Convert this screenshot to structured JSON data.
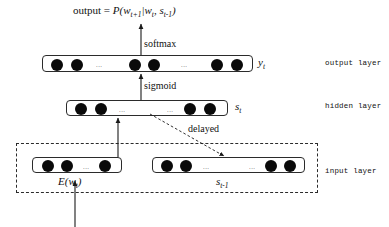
{
  "figure": {
    "title_formula": {
      "prefix": "output = ",
      "body": "P(w",
      "sub1": "t+1",
      "mid": "|w",
      "sub2": "t",
      "comma": ", s",
      "sub3": "t-1",
      "suffix": ")",
      "plain": "output = P(w_t+1|w_t, s_t-1)"
    },
    "operations": [
      {
        "name": "softmax",
        "label": "softmax"
      },
      {
        "name": "sigmoid",
        "label": "sigmoid"
      },
      {
        "name": "delayed",
        "label": "delayed"
      }
    ],
    "layer_names": [
      {
        "key": "output",
        "label": "output layer"
      },
      {
        "key": "hidden",
        "label": "hidden layer"
      },
      {
        "key": "input",
        "label": "input layer"
      }
    ],
    "layers": [
      {
        "key": "output",
        "symbol_base": "y",
        "symbol_sub": "t",
        "symbol_plain": "y_t",
        "node_count": 6,
        "ellipsis_count": 2,
        "ellipsis_glyph": "..."
      },
      {
        "key": "hidden",
        "symbol_base": "s",
        "symbol_sub": "t",
        "symbol_plain": "s_t",
        "node_count": 4,
        "ellipsis_count": 2,
        "ellipsis_glyph": "..."
      },
      {
        "key": "input_embedding",
        "symbol_base": "E(w",
        "symbol_sub": "t",
        "symbol_suffix": ")",
        "symbol_plain": "E(w_t)",
        "node_count": 3,
        "ellipsis_count": 1,
        "ellipsis_glyph": "..."
      },
      {
        "key": "input_recurrent",
        "symbol_base": "s",
        "symbol_sub": "t-1",
        "symbol_plain": "s_t-1",
        "node_count": 4,
        "ellipsis_count": 2,
        "ellipsis_glyph": "..."
      }
    ],
    "colors": {
      "node_fill": "#0a0a0a",
      "box_stroke": "#2b2b2b",
      "arrow_stroke": "#1a1a1a",
      "background": "#ffffff",
      "text": "#111111"
    }
  }
}
